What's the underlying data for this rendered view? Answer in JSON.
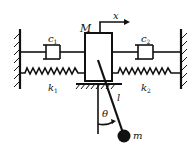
{
  "diagram": {
    "labels": {
      "mass_block": "M",
      "displacement": "x",
      "damper_left": "c",
      "damper_left_sub": "1",
      "damper_right": "c",
      "damper_right_sub": "2",
      "spring_left": "k",
      "spring_left_sub": "1",
      "spring_right": "k",
      "spring_right_sub": "2",
      "pendulum_length": "l",
      "angle": "θ",
      "bob_mass": "m"
    },
    "colors": {
      "stroke": "#111111",
      "background": "#ffffff"
    }
  }
}
